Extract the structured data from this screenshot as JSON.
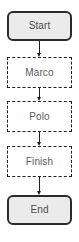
{
  "diagram": {
    "type": "flowchart",
    "orientation": "vertical",
    "background_color": "#ffffff",
    "nodes": [
      {
        "id": "start",
        "label": "Start",
        "shape": "rounded-rectangle",
        "style": "solid",
        "fill_color": "#ebebeb",
        "border_color": "#2b2b2b",
        "text_color": "#4d4d4d"
      },
      {
        "id": "marco",
        "label": "Marco",
        "shape": "rectangle",
        "style": "dashed",
        "fill_color": "#ffffff",
        "border_color": "#1f1f1f",
        "text_color": "#5a5a5a"
      },
      {
        "id": "polo",
        "label": "Polo",
        "shape": "rectangle",
        "style": "dashed",
        "fill_color": "#ffffff",
        "border_color": "#1f1f1f",
        "text_color": "#5a5a5a"
      },
      {
        "id": "finish",
        "label": "Finish",
        "shape": "rectangle",
        "style": "dashed",
        "fill_color": "#ffffff",
        "border_color": "#1f1f1f",
        "text_color": "#5a5a5a"
      },
      {
        "id": "end",
        "label": "End",
        "shape": "rounded-rectangle",
        "style": "solid",
        "fill_color": "#ebebeb",
        "border_color": "#2b2b2b",
        "text_color": "#4d4d4d"
      }
    ],
    "edges": [
      {
        "id": "start-to-marco",
        "from": "Start",
        "to": "Marco",
        "arrow": "down"
      },
      {
        "id": "marco-to-polo",
        "from": "Marco",
        "to": "Polo",
        "arrow": "down"
      },
      {
        "id": "polo-to-finish",
        "from": "Polo",
        "to": "Finish",
        "arrow": "down"
      },
      {
        "id": "finish-to-end",
        "from": "Finish",
        "to": "End",
        "arrow": "down"
      }
    ]
  }
}
